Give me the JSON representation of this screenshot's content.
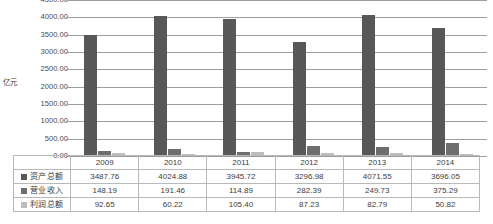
{
  "chart_data": {
    "type": "bar",
    "title": "",
    "subtitle": "",
    "xlabel": "",
    "ylabel": "亿元",
    "categories": [
      "2009",
      "2010",
      "2011",
      "2012",
      "2013",
      "2014"
    ],
    "series": [
      {
        "name": "资产总额",
        "color": "#585858",
        "values": [
          3487.76,
          4024.88,
          3945.72,
          3296.98,
          4071.55,
          3696.05
        ],
        "labels": [
          "3487.76",
          "4024.88",
          "3945.72",
          "3296.98",
          "4071.55",
          "3696.05"
        ]
      },
      {
        "name": "营业收入",
        "color": "#6e6e6e",
        "values": [
          148.19,
          191.46,
          114.89,
          282.39,
          249.73,
          375.29
        ],
        "labels": [
          "148.19",
          "191.46",
          "114.89",
          "282.39",
          "249.73",
          "375.29"
        ]
      },
      {
        "name": "利润总额",
        "color": "#bdbdbd",
        "values": [
          92.65,
          60.22,
          105.4,
          87.23,
          82.79,
          50.82
        ],
        "labels": [
          "92.65",
          "60.22",
          "105.40",
          "87.23",
          "82.79",
          "50.82"
        ]
      }
    ],
    "ylim": [
      0,
      4500
    ],
    "ytick_step": 500,
    "ytick_labels": [
      "4500.00",
      "4000.00",
      "3500.00",
      "3000.00",
      "2500.00",
      "2000.00",
      "1500.00",
      "1000.00",
      "500.00",
      "0.00"
    ],
    "grid": true,
    "legend_position": "table-left-column",
    "data_table_visible": true
  },
  "axis": {
    "y_title": "亿元"
  },
  "table": {
    "year_row_label": "",
    "years": [
      "2009",
      "2010",
      "2011",
      "2012",
      "2013",
      "2014"
    ],
    "rows": [
      {
        "label": "资产总额",
        "values": [
          "3487.76",
          "4024.88",
          "3945.72",
          "3296.98",
          "4071.55",
          "3696.05"
        ]
      },
      {
        "label": "营业收入",
        "values": [
          "148.19",
          "191.46",
          "114.89",
          "282.39",
          "249.73",
          "375.29"
        ]
      },
      {
        "label": "利润总额",
        "values": [
          "92.65",
          "60.22",
          "105.40",
          "87.23",
          "82.79",
          "50.82"
        ]
      }
    ]
  },
  "colors": {
    "series_asset": "#585858",
    "series_revenue": "#6e6e6e",
    "series_profit": "#bdbdbd",
    "gridline": "#9d9d9d",
    "table_border": "#b9b9b9",
    "background": "#ffffff"
  }
}
